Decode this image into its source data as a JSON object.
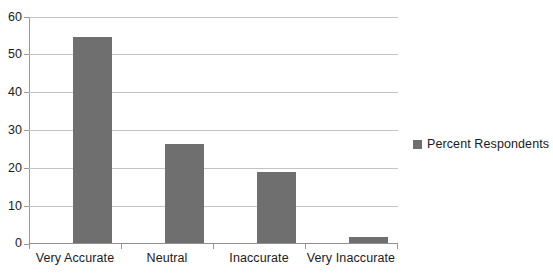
{
  "chart_data": {
    "type": "bar",
    "title": "",
    "subtitle": "",
    "xlabel": "",
    "ylabel": "",
    "categories": [
      "Very Accurate",
      "Neutral",
      "Inaccurate",
      "Very Inaccurate"
    ],
    "values": [
      55,
      26.5,
      19,
      1.5
    ],
    "series": [
      {
        "name": "Percent Respondents",
        "values": [
          55,
          26.5,
          19,
          1.5
        ],
        "color": "#6f6f6f"
      }
    ],
    "ylim": [
      0,
      60
    ],
    "ytick_values": [
      0,
      10,
      20,
      30,
      40,
      50,
      60
    ],
    "ytick_labels": [
      "0",
      "10",
      "20",
      "30",
      "40",
      "50",
      "60"
    ],
    "grid": true,
    "grid_color": "#c4c4c4",
    "axis_color": "#9a9a9a",
    "legend": {
      "position": "right",
      "entries": [
        {
          "label": "Percent Respondents",
          "color": "#6f6f6f"
        }
      ]
    }
  },
  "legend": {
    "series_label": "Percent Respondents"
  },
  "axis": {
    "y": {
      "t0": "0",
      "t10": "10",
      "t20": "20",
      "t30": "30",
      "t40": "40",
      "t50": "50",
      "t60": "60"
    },
    "x": {
      "c0": "Very Accurate",
      "c1": "Neutral",
      "c2": "Inaccurate",
      "c3": "Very Inaccurate"
    }
  }
}
